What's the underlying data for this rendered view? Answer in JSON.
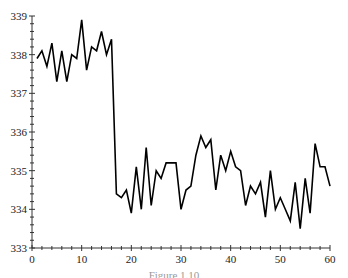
{
  "chart_data": {
    "type": "line",
    "title": "",
    "xlabel": "",
    "ylabel": "",
    "xlim": [
      0,
      60
    ],
    "ylim": [
      333,
      339
    ],
    "x_ticks": [
      0,
      10,
      20,
      30,
      40,
      50,
      60
    ],
    "y_ticks": [
      333,
      334,
      335,
      336,
      337,
      338,
      339
    ],
    "grid": false,
    "legend": null,
    "series": [
      {
        "name": "series",
        "color": "#000000",
        "x": [
          1,
          2,
          3,
          4,
          5,
          6,
          7,
          8,
          9,
          10,
          11,
          12,
          13,
          14,
          15,
          16,
          17,
          18,
          19,
          20,
          21,
          22,
          23,
          24,
          25,
          26,
          27,
          28,
          29,
          30,
          31,
          32,
          33,
          34,
          35,
          36,
          37,
          38,
          39,
          40,
          41,
          42,
          43,
          44,
          45,
          46,
          47,
          48,
          49,
          50,
          51,
          52,
          53,
          54,
          55,
          56,
          57,
          58,
          59,
          60
        ],
        "values": [
          337.9,
          338.1,
          337.7,
          338.3,
          337.3,
          338.1,
          337.3,
          338.0,
          337.9,
          338.9,
          337.6,
          338.2,
          338.1,
          338.6,
          338.0,
          338.4,
          334.4,
          334.3,
          334.5,
          333.9,
          335.1,
          334.0,
          335.6,
          334.1,
          335.0,
          334.8,
          335.2,
          335.2,
          335.2,
          334.0,
          334.5,
          334.6,
          335.4,
          335.9,
          335.6,
          335.8,
          334.5,
          335.4,
          335.0,
          335.5,
          335.1,
          335.0,
          334.1,
          334.6,
          334.4,
          334.7,
          333.8,
          335.0,
          334.0,
          334.3,
          334.0,
          333.7,
          334.7,
          333.5,
          334.8,
          333.9,
          335.7,
          335.1,
          335.1,
          334.6
        ]
      }
    ]
  },
  "caption": "Figure 1.10"
}
